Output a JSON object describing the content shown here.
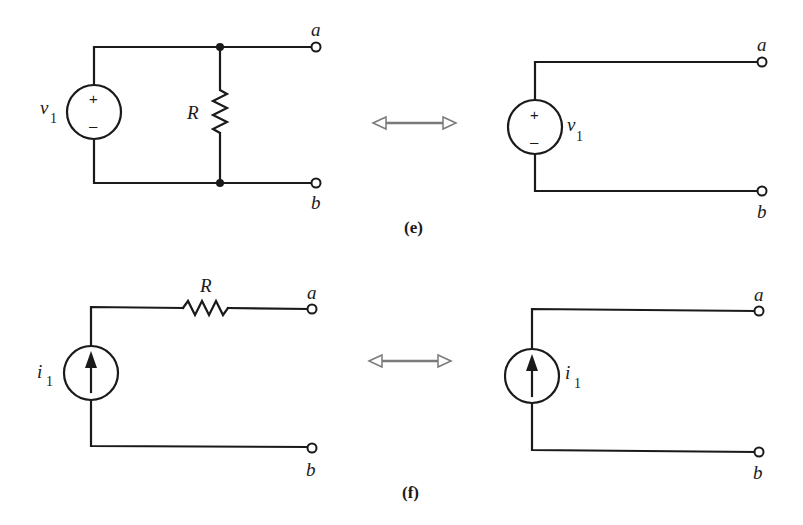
{
  "figure": {
    "panels": [
      {
        "id": "e",
        "caption": "(e)",
        "left_circuit": {
          "source_type": "voltage",
          "source_label": "v",
          "source_subscript": "1",
          "plus_sign": "+",
          "minus_sign": "–",
          "resistor_label": "R",
          "resistor_configuration": "parallel",
          "terminal_top": "a",
          "terminal_bottom": "b"
        },
        "right_circuit": {
          "source_type": "voltage",
          "source_label": "v",
          "source_subscript": "1",
          "plus_sign": "+",
          "minus_sign": "–",
          "terminal_top": "a",
          "terminal_bottom": "b"
        },
        "equivalence_symbol": "double-arrow"
      },
      {
        "id": "f",
        "caption": "(f)",
        "left_circuit": {
          "source_type": "current",
          "source_label": "i",
          "source_subscript": "1",
          "resistor_label": "R",
          "resistor_configuration": "series",
          "terminal_top": "a",
          "terminal_bottom": "b"
        },
        "right_circuit": {
          "source_type": "current",
          "source_label": "i",
          "source_subscript": "1",
          "terminal_top": "a",
          "terminal_bottom": "b"
        },
        "equivalence_symbol": "double-arrow"
      }
    ]
  }
}
